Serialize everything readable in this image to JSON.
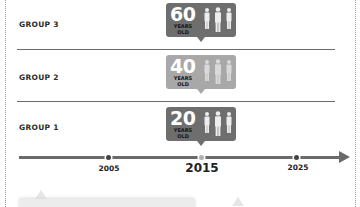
{
  "diagram": {
    "type": "age-cohort-timeline",
    "groups": [
      {
        "label": "GROUP 3",
        "age": "60",
        "age_caption_line1": "YEARS",
        "age_caption_line2": "OLD",
        "color": "#6e6e6e"
      },
      {
        "label": "GROUP 2",
        "age": "40",
        "age_caption_line1": "YEARS",
        "age_caption_line2": "OLD",
        "color": "#a8a8a8"
      },
      {
        "label": "GROUP 1",
        "age": "20",
        "age_caption_line1": "YEARS",
        "age_caption_line2": "OLD",
        "color": "#6e6e6e"
      }
    ],
    "timeline": {
      "ticks": [
        {
          "label": "2005",
          "emphasis": false
        },
        {
          "label": "2015",
          "emphasis": true
        },
        {
          "label": "2025",
          "emphasis": false
        }
      ],
      "line_color": "#6a6a6a"
    },
    "icons": {
      "people": "three-people-icon"
    }
  }
}
